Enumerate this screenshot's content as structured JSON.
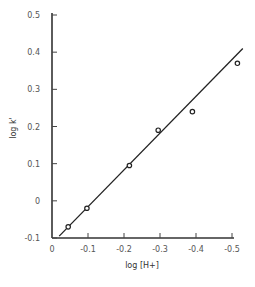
{
  "chart_data": {
    "type": "scatter",
    "title": "",
    "xlabel": "log [H+]",
    "ylabel": "log k'",
    "xlim": [
      0,
      -0.5
    ],
    "ylim": [
      -0.1,
      0.5
    ],
    "grid": false,
    "legend": null,
    "x_ticks": [
      "0",
      "-0.1",
      "-0.2",
      "-0.3",
      "-0.4",
      "-0.5"
    ],
    "y_ticks": [
      "-0.1",
      "0",
      "0.1",
      "0.2",
      "0.3",
      "0.4",
      "0.5"
    ],
    "series": [
      {
        "name": "data",
        "marker": "open-circle",
        "x": [
          -0.045,
          -0.097,
          -0.215,
          -0.295,
          -0.39,
          -0.515
        ],
        "y": [
          -0.07,
          -0.02,
          0.095,
          0.19,
          0.24,
          0.37
        ]
      },
      {
        "name": "fit",
        "style": "line",
        "x": [
          -0.02,
          -0.53
        ],
        "y": [
          -0.095,
          0.41
        ]
      }
    ]
  }
}
